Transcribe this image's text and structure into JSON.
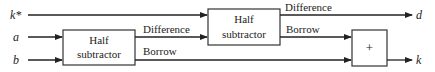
{
  "diagram": {
    "inputs": [
      {
        "id": "kstar",
        "label": "k*"
      },
      {
        "id": "a",
        "label": "a"
      },
      {
        "id": "b",
        "label": "b"
      }
    ],
    "outputs": [
      {
        "id": "d",
        "label": "d"
      },
      {
        "id": "k",
        "label": "k"
      }
    ],
    "blocks": [
      {
        "id": "hs1",
        "line1": "Half",
        "line2": "subtractor"
      },
      {
        "id": "hs2",
        "line1": "Half",
        "line2": "subtractor"
      },
      {
        "id": "or",
        "label": "+"
      }
    ],
    "edges": [
      {
        "from": "hs1",
        "label": "Difference",
        "to": "hs2"
      },
      {
        "from": "hs1",
        "label": "Borrow",
        "to": "or"
      },
      {
        "from": "hs2",
        "label": "Difference",
        "to": "d"
      },
      {
        "from": "hs2",
        "label": "Borrow",
        "to": "or"
      }
    ]
  }
}
